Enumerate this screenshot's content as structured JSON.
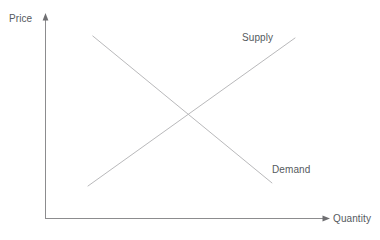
{
  "chart_data": {
    "type": "line",
    "title": "",
    "subtitle": "",
    "xlabel": "Quantity",
    "ylabel": "Price",
    "grid": false,
    "legend_position": "inline-curve-labels",
    "axis_style": "arrow-headed open axes, no tick marks, no numeric scale",
    "xlim": [
      0,
      1
    ],
    "ylim": [
      0,
      1
    ],
    "xticks": [],
    "yticks": [],
    "xticklabels": [],
    "yticklabels": [],
    "series": [
      {
        "name": "Supply",
        "slope": "positive",
        "x": [
          0.151,
          0.878
        ],
        "y": [
          0.161,
          0.883
        ],
        "annotation": "Supply",
        "color": "#b9b9bb"
      },
      {
        "name": "Demand",
        "slope": "negative",
        "x": [
          0.168,
          0.797
        ],
        "y": [
          0.893,
          0.176
        ],
        "annotation": "Demand",
        "color": "#b9b9bb"
      }
    ],
    "annotations": [
      {
        "text": "Supply",
        "x": 0.691,
        "y": 0.911
      },
      {
        "text": "Demand",
        "x": 0.797,
        "y": 0.268
      }
    ],
    "intersection": {
      "x": 0.509,
      "y": 0.522,
      "meaning": "market equilibrium"
    }
  },
  "axes": {
    "y_axis_label": "Price",
    "x_axis_label": "Quantity",
    "axis_color": "#8c8c8e"
  },
  "curves": {
    "supply_label": "Supply",
    "demand_label": "Demand",
    "curve_color": "#bdbdbf"
  },
  "colors": {
    "background": "#ffffff",
    "text": "#555a5e",
    "axis": "#8c8c8e",
    "curve": "#bdbdbf"
  }
}
